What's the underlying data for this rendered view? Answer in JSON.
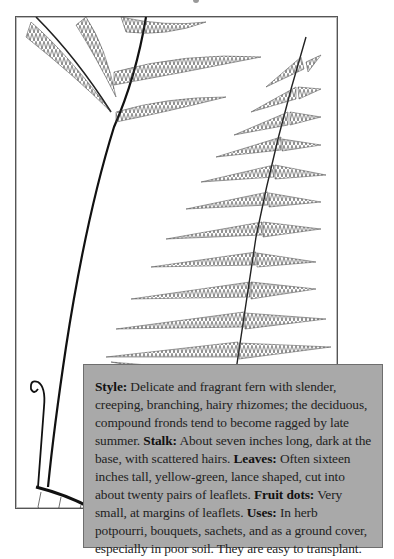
{
  "illustration": {
    "subject": "fern-illustration",
    "description": "Line drawing of fern fronds with stalks, rhizome, fiddlehead and roots"
  },
  "info_box": {
    "sections": [
      {
        "label": "Style:",
        "text": " Delicate and fragrant fern with slender, creep­ing, branching, hairy rhizomes; the deciduous, compound fronds tend to become ragged by late summer. "
      },
      {
        "label": "Stalk:",
        "text": " About seven inches long, dark at the base, with scattered hairs. "
      },
      {
        "label": "Leaves:",
        "text": " Often sixteen inches tall, yellow-green, lance shaped, cut into about twenty pairs of leaflets. "
      },
      {
        "label": "Fruit dots:",
        "text": " Very small, at margins of leaflets. "
      },
      {
        "label": "Uses:",
        "text": " In herb potpourri, bou­quets, sachets, and as a ground cover, especially in poor soil. They are easy to transplant."
      }
    ],
    "colors": {
      "background": "#a9a9a9",
      "border": "#6e6e6e",
      "text": "#222222"
    }
  }
}
